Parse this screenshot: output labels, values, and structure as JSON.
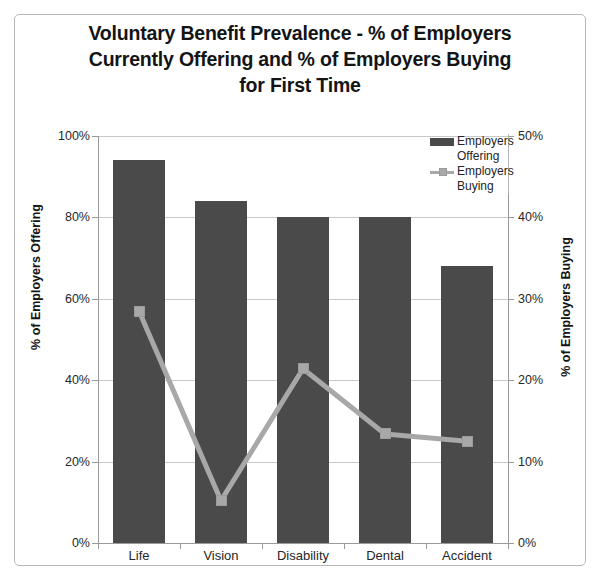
{
  "chart_data": {
    "type": "bar",
    "title": "Voluntary Benefit Prevalence - % of Employers Currently Offering and % of Employers Buying for First Time",
    "title_lines": [
      "Voluntary Benefit Prevalence - % of Employers",
      "Currently Offering and % of Employers Buying",
      "for First Time"
    ],
    "categories": [
      "Life",
      "Vision",
      "Disability",
      "Dental",
      "Accident"
    ],
    "series": [
      {
        "name": "Employers Offering",
        "type": "bar",
        "axis": "left",
        "color": "#4a4a4a",
        "values": [
          94,
          84,
          80,
          80,
          68
        ]
      },
      {
        "name": "Employers Buying",
        "type": "line",
        "axis": "right",
        "color": "#a8a8a8",
        "values": [
          28.5,
          5.2,
          21.4,
          13.4,
          12.5
        ]
      }
    ],
    "xlabel": "",
    "ylabel": "% of Employers Offering",
    "ylabel_right": "% of Employers Buying",
    "ylim": [
      0,
      100
    ],
    "ylim_right": [
      0,
      50
    ],
    "yticks": [
      "0%",
      "20%",
      "40%",
      "60%",
      "80%",
      "100%"
    ],
    "ytick_values": [
      0,
      20,
      40,
      60,
      80,
      100
    ],
    "yticks_right": [
      "0%",
      "10%",
      "20%",
      "30%",
      "40%",
      "50%"
    ],
    "ytick_values_right": [
      0,
      10,
      20,
      30,
      40,
      50
    ],
    "grid": true,
    "legend_position": "top-right",
    "legend": [
      {
        "label_line1": "Employers",
        "label_line2": "Offering",
        "marker": "bar-swatch",
        "color": "#4a4a4a"
      },
      {
        "label_line1": "Employers",
        "label_line2": "Buying",
        "marker": "line-swatch",
        "color": "#a8a8a8"
      }
    ]
  }
}
